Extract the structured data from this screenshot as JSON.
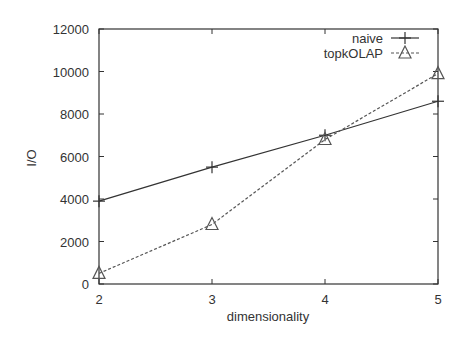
{
  "chart_data": {
    "type": "line",
    "title": "",
    "xlabel": "dimensionality",
    "ylabel": "I/O",
    "x": [
      2,
      3,
      4,
      5
    ],
    "xlim": [
      2,
      5
    ],
    "ylim": [
      0,
      12000
    ],
    "xticks": [
      "2",
      "3",
      "4",
      "5"
    ],
    "yticks": [
      "0",
      "2000",
      "4000",
      "6000",
      "8000",
      "10000",
      "12000"
    ],
    "grid": false,
    "legend_position": "top-right",
    "series": [
      {
        "name": "naive",
        "style": "solid",
        "marker": "plus",
        "values": [
          3900,
          5500,
          7000,
          8600
        ]
      },
      {
        "name": "topkOLAP",
        "style": "dashed",
        "marker": "triangle",
        "values": [
          500,
          2800,
          6800,
          9900
        ]
      }
    ]
  },
  "colors": {
    "axis": "#333333",
    "naive": "#333333",
    "topkOLAP": "#555555"
  }
}
